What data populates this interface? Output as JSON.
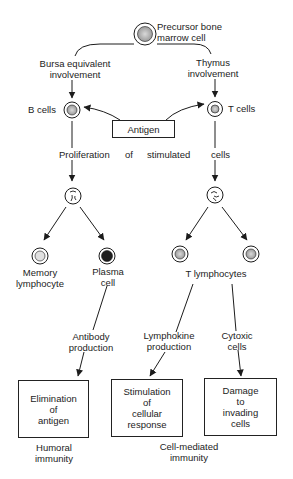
{
  "diagram": {
    "type": "immune-response-flowchart",
    "nodes": {
      "precursor": {
        "label_line1": "Precursor bone",
        "label_line2": "marrow cell"
      },
      "bursa": {
        "label_line1": "Bursa equivalent",
        "label_line2": "involvement"
      },
      "thymus": {
        "label_line1": "Thymus",
        "label_line2": "involvement"
      },
      "b_cells": {
        "label": "B cells"
      },
      "t_cells": {
        "label": "T cells"
      },
      "antigen": {
        "label": "Antigen"
      },
      "proliferation": {
        "word1": "Proliferation",
        "word2": "of",
        "word3": "stimulated",
        "word4": "cells"
      },
      "memory": {
        "label_line1": "Memory",
        "label_line2": "lymphocyte"
      },
      "plasma": {
        "label_line1": "Plasma",
        "label_line2": "cell"
      },
      "t_lymphocytes": {
        "label": "T lymphocytes"
      },
      "antibody": {
        "label_line1": "Antibody",
        "label_line2": "production"
      },
      "lymphokine": {
        "label_line1": "Lymphokine",
        "label_line2": "production"
      },
      "cytoxic": {
        "label_line1": "Cytoxic",
        "label_line2": "cells"
      },
      "elimination": {
        "line1": "Elimination",
        "line2": "of",
        "line3": "antigen"
      },
      "stimulation": {
        "line1": "Stimulation",
        "line2": "of",
        "line3": "cellular",
        "line4": "response"
      },
      "damage": {
        "line1": "Damage",
        "line2": "to",
        "line3": "invading",
        "line4": "cells"
      },
      "humoral": {
        "label_line1": "Humoral",
        "label_line2": "immunity"
      },
      "cell_mediated": {
        "label_line1": "Cell-mediated",
        "label_line2": "immunity"
      }
    },
    "edges": [
      {
        "from": "precursor",
        "to": "b_cells",
        "via": "bursa"
      },
      {
        "from": "precursor",
        "to": "t_cells",
        "via": "thymus"
      },
      {
        "from": "antigen",
        "to": "b_cells"
      },
      {
        "from": "antigen",
        "to": "t_cells"
      },
      {
        "from": "b_cells",
        "to": "b_dividing",
        "via": "proliferation"
      },
      {
        "from": "t_cells",
        "to": "t_dividing",
        "via": "proliferation"
      },
      {
        "from": "b_dividing",
        "to": "memory"
      },
      {
        "from": "b_dividing",
        "to": "plasma"
      },
      {
        "from": "t_dividing",
        "to": "t_lymphocytes"
      },
      {
        "from": "plasma",
        "to": "elimination",
        "via": "antibody"
      },
      {
        "from": "t_lymphocytes",
        "to": "stimulation",
        "via": "lymphokine"
      },
      {
        "from": "t_lymphocytes",
        "to": "damage",
        "via": "cytoxic"
      }
    ]
  }
}
